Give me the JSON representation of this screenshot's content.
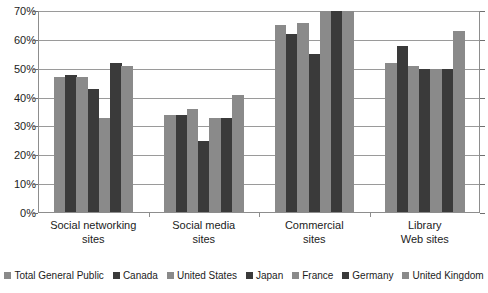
{
  "chart_data": {
    "type": "bar",
    "title": "",
    "subtitle": "",
    "xlabel": "",
    "ylabel": "",
    "ylim": [
      0,
      70
    ],
    "ytick_step": 10,
    "ytick_labels": [
      "0%",
      "10%",
      "20%",
      "30%",
      "40%",
      "50%",
      "60%",
      "70%"
    ],
    "ytick_values": [
      0,
      10,
      20,
      30,
      40,
      50,
      60,
      70
    ],
    "grid": true,
    "grid_axis": "y",
    "legend_position": "bottom",
    "orientation": "vertical",
    "categories": [
      "Social networking sites",
      "Social media sites",
      "Commercial sites",
      "Library Web sites"
    ],
    "category_lines": [
      [
        "Social networking",
        "sites"
      ],
      [
        "Social media",
        "sites"
      ],
      [
        "Commercial",
        "sites"
      ],
      [
        "Library",
        "Web sites"
      ]
    ],
    "series": [
      {
        "name": "Total General Public",
        "color": "#8a8a8a",
        "values": [
          47,
          34,
          65,
          52
        ]
      },
      {
        "name": "Canada",
        "color": "#3a3a3a",
        "values": [
          48,
          34,
          62,
          58
        ]
      },
      {
        "name": "United States",
        "color": "#8a8a8a",
        "values": [
          47,
          36,
          66,
          51
        ]
      },
      {
        "name": "Japan",
        "color": "#3a3a3a",
        "values": [
          43,
          25,
          55,
          50
        ]
      },
      {
        "name": "France",
        "color": "#8a8a8a",
        "values": [
          33,
          33,
          70,
          50
        ]
      },
      {
        "name": "Germany",
        "color": "#3a3a3a",
        "values": [
          52,
          33,
          70,
          50
        ]
      },
      {
        "name": "United Kingdom",
        "color": "#8a8a8a",
        "values": [
          51,
          41,
          70,
          63
        ]
      }
    ]
  }
}
